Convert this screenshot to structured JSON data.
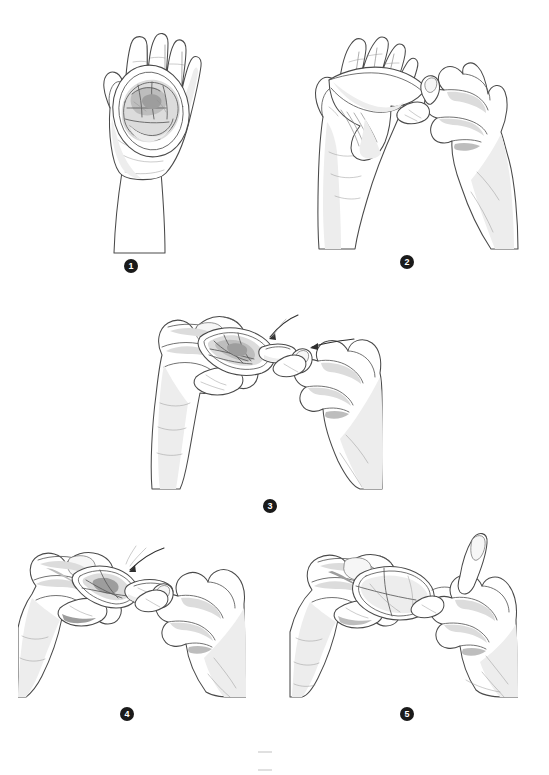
{
  "document": {
    "title": "Hand Instruction Sequence",
    "subject": "five-step illustrated hand technique sequence",
    "background_color": "#ffffff",
    "ink_color": "#4a4a4a",
    "badge_color": "#1a1a1a",
    "badge_text_color": "#ffffff",
    "canvas": {
      "width": 549,
      "height": 752
    }
  },
  "steps": [
    {
      "number": "1",
      "label": "step-1",
      "caption": "",
      "description": "Open flat palm of left hand held upright, fingers together, cradling a soft rolled pouch inside an oval outer ring resting on the palm.",
      "hands": "one hand, palm up",
      "badge": {
        "x": 124,
        "y": 259
      },
      "panel": {
        "x": 62,
        "y": 22,
        "width": 175,
        "height": 232
      },
      "arrows": 0
    },
    {
      "number": "2",
      "label": "step-2",
      "caption": "",
      "description": "Two hands side by side; left hand holds the pouch draped over the fingers while the right hand pinches the flexible inner ring between thumb and index finger.",
      "hands": "two hands",
      "badge": {
        "x": 400,
        "y": 255
      },
      "panel": {
        "x": 305,
        "y": 22,
        "width": 215,
        "height": 228
      },
      "arrows": 0
    },
    {
      "number": "3",
      "label": "step-3",
      "caption": "",
      "description": "Close view of both hands squeezing the inner ring into a narrow oval; two small direction arrows point inward toward the compressed ring.",
      "hands": "two hands",
      "badge": {
        "x": 263,
        "y": 499
      },
      "panel": {
        "x": 148,
        "y": 285,
        "width": 235,
        "height": 205
      },
      "arrows": 2
    },
    {
      "number": "4",
      "label": "step-4",
      "caption": "",
      "description": "Both hands working together, fingertips pressing the flattened ring between them; a direction arrow indicates the squeezing motion.",
      "hands": "two hands",
      "badge": {
        "x": 120,
        "y": 707
      },
      "panel": {
        "x": 18,
        "y": 528,
        "width": 228,
        "height": 170
      },
      "arrows": 1
    },
    {
      "number": "5",
      "label": "step-5",
      "caption": "",
      "description": "Both hands with fingers interlaced guiding the narrowed pouch forward; left hand cups while right hand extends the index finger alongside.",
      "hands": "two hands",
      "badge": {
        "x": 400,
        "y": 707
      },
      "panel": {
        "x": 288,
        "y": 528,
        "width": 230,
        "height": 170
      },
      "arrows": 0
    }
  ],
  "footer": {
    "mark": "",
    "visible": true
  }
}
